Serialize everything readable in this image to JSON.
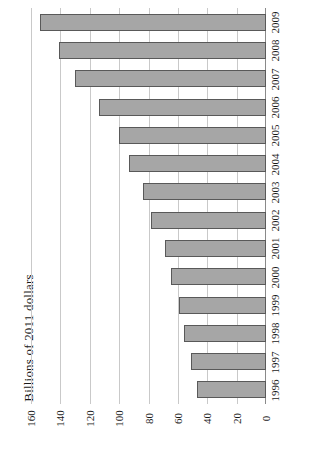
{
  "chart_data": {
    "type": "bar",
    "orientation": "horizontal",
    "title": "",
    "subtitle": "",
    "xlabel": "",
    "ylabel": "Billions of 2011 dollars",
    "categories": [
      "1996",
      "1997",
      "1998",
      "1999",
      "2000",
      "2001",
      "2002",
      "2003",
      "2004",
      "2005",
      "2006",
      "2007",
      "2008",
      "2009"
    ],
    "values": [
      47,
      51,
      56,
      59,
      65,
      69,
      78,
      84,
      93,
      100,
      114,
      130,
      141,
      154
    ],
    "value_ticks": [
      0,
      20,
      40,
      60,
      80,
      100,
      120,
      140,
      160
    ],
    "xlim": [
      0,
      160
    ],
    "grid": true,
    "legend": null,
    "bar_fill_color": "#a6a6a6",
    "bar_border_color": "#595959",
    "gridline_color": "#c9c9c9",
    "axis_color": "#8a8a8a"
  },
  "axis": {
    "value_axis_title": "Billions of 2011 dollars",
    "value_tick_labels": [
      "0",
      "20",
      "40",
      "60",
      "80",
      "100",
      "120",
      "140",
      "160"
    ],
    "category_tick_labels": [
      "1996",
      "1997",
      "1998",
      "1999",
      "2000",
      "2001",
      "2002",
      "2003",
      "2004",
      "2005",
      "2006",
      "2007",
      "2008",
      "2009"
    ]
  }
}
